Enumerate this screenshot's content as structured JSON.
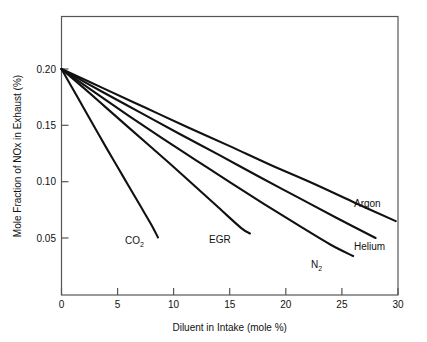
{
  "chart_data": {
    "type": "line",
    "title": "",
    "xlabel": "Diluent in Intake (mole %)",
    "ylabel": "Mole Fraction of NOx in Exhaust (%)",
    "xlim": [
      0,
      30
    ],
    "ylim": [
      0.0,
      0.225
    ],
    "grid": false,
    "legend": "inline-end-labels",
    "xticks": [
      0,
      5,
      10,
      15,
      20,
      25,
      30
    ],
    "xtick_labels": [
      "0",
      "5",
      "10",
      "15",
      "20",
      "25",
      "30"
    ],
    "yticks": [
      0.05,
      0.1,
      0.15,
      0.2
    ],
    "ytick_labels": [
      "0.05",
      "0.10",
      "0.15",
      "0.20"
    ],
    "series": [
      {
        "name": "CO2",
        "label_text": "CO",
        "label_sub": "2",
        "x": [
          0,
          1,
          2,
          3,
          4,
          5,
          6,
          7,
          8,
          8.6
        ],
        "y": [
          0.2,
          0.1825,
          0.165,
          0.1475,
          0.13,
          0.113,
          0.096,
          0.079,
          0.062,
          0.0505
        ]
      },
      {
        "name": "EGR",
        "label_text": "EGR",
        "label_sub": "",
        "x": [
          0,
          2,
          4,
          6,
          8,
          10,
          12,
          14,
          16,
          16.8
        ],
        "y": [
          0.2,
          0.183,
          0.1655,
          0.148,
          0.1305,
          0.113,
          0.095,
          0.077,
          0.059,
          0.054
        ]
      },
      {
        "name": "N2",
        "label_text": "N",
        "label_sub": "2",
        "x": [
          0,
          3,
          6,
          9,
          12,
          15,
          18,
          21,
          24,
          26
        ],
        "y": [
          0.2,
          0.179,
          0.1585,
          0.1385,
          0.119,
          0.0995,
          0.0805,
          0.062,
          0.044,
          0.034
        ]
      },
      {
        "name": "Helium",
        "label_text": "Helium",
        "label_sub": "",
        "x": [
          0,
          3.5,
          7,
          10.5,
          14,
          17.5,
          21,
          24.5,
          28
        ],
        "y": [
          0.2,
          0.1805,
          0.1615,
          0.1425,
          0.124,
          0.105,
          0.0865,
          0.068,
          0.05
        ]
      },
      {
        "name": "Argon",
        "label_text": "Argon",
        "label_sub": "",
        "x": [
          0,
          3.7,
          7.4,
          11.1,
          14.9,
          18.6,
          22.3,
          26.0,
          29.8
        ],
        "y": [
          0.2,
          0.183,
          0.166,
          0.149,
          0.132,
          0.115,
          0.099,
          0.082,
          0.065
        ]
      }
    ],
    "annotations": [
      {
        "text": "CO2",
        "x_px": 133,
        "y_px": 240
      },
      {
        "text": "EGR",
        "x_px": 212,
        "y_px": 241
      },
      {
        "text": "N2",
        "x_px": 313,
        "y_px": 266
      },
      {
        "text": "Helium",
        "x_px": 357,
        "y_px": 248
      },
      {
        "text": "Argon",
        "x_px": 357,
        "y_px": 204
      }
    ],
    "colors": {
      "line": "#111111",
      "frame": "#555555",
      "background": "#ffffff"
    }
  }
}
